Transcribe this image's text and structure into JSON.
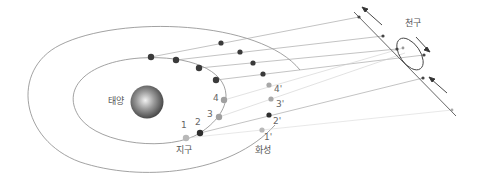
{
  "labels": {
    "sun": "태양",
    "earth": "지구",
    "mars": "화성",
    "celestial_sphere": "천구"
  },
  "earth_positions": [
    "1",
    "2",
    "3",
    "4"
  ],
  "mars_positions": [
    "1'",
    "2'",
    "3'",
    "4'"
  ],
  "colors": {
    "orbit": "#888888",
    "dark_point": "#3a3a3a",
    "light_point": "#a8a8a8",
    "sight_line_dark": "#9a9a9a",
    "sight_line_light": "#d0d0d0"
  }
}
